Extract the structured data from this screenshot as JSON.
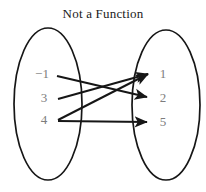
{
  "title": "Not a Function",
  "colors": {
    "background": "#ffffff",
    "title_text": "#1a1a1a",
    "node_text": "#7d7d7d",
    "ellipse_stroke": "#161616",
    "arrow_stroke": "#161616"
  },
  "domain_set": {
    "name": "domain",
    "nodes": [
      {
        "id": "d0",
        "label": "−1",
        "x": 42,
        "y": 74
      },
      {
        "id": "d1",
        "label": "3",
        "x": 44,
        "y": 98
      },
      {
        "id": "d2",
        "label": "4",
        "x": 44,
        "y": 120
      }
    ],
    "ellipse": {
      "cx": 48,
      "cy": 104,
      "rx": 34,
      "ry": 76
    }
  },
  "codomain_set": {
    "name": "codomain",
    "nodes": [
      {
        "id": "r0",
        "label": "1",
        "x": 163,
        "y": 74
      },
      {
        "id": "r1",
        "label": "2",
        "x": 163,
        "y": 98
      },
      {
        "id": "r2",
        "label": "5",
        "x": 163,
        "y": 122
      }
    ],
    "ellipse": {
      "cx": 166,
      "cy": 105,
      "rx": 34,
      "ry": 75
    }
  },
  "mappings": [
    {
      "from": "−1",
      "to": "2",
      "x1": 57,
      "y1": 76,
      "x2": 147,
      "y2": 97
    },
    {
      "from": "3",
      "to": "1",
      "x1": 58,
      "y1": 99,
      "x2": 148,
      "y2": 74
    },
    {
      "from": "4",
      "to": "1",
      "x1": 58,
      "y1": 120,
      "x2": 148,
      "y2": 74
    },
    {
      "from": "4",
      "to": "5",
      "x1": 58,
      "y1": 121,
      "x2": 147,
      "y2": 122
    }
  ]
}
